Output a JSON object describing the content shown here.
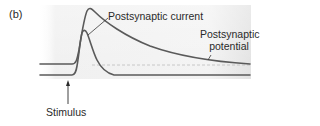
{
  "panel": {
    "label": "(b)"
  },
  "labels": {
    "current": "Postsynaptic current",
    "potential_line1": "Postsynaptic",
    "potential_line2": "potential",
    "stimulus": "Stimulus"
  },
  "colors": {
    "trace": "#5a5a5a",
    "panel_bg_light": "#f7f7f7",
    "panel_bg_dark": "#dcdcdc",
    "dashed_baseline": "#bdbdbd",
    "text": "#2a2a2a"
  }
}
